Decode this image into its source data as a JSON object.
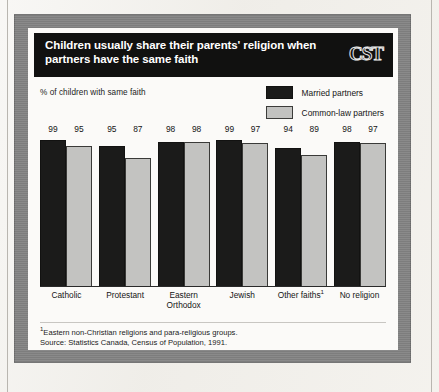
{
  "figure": {
    "title": "Children usually share their parents' religion when\npartners have the same faith",
    "logo": "CST",
    "axis_note": "% of children with same faith"
  },
  "legend": {
    "position": "top-right",
    "items": [
      {
        "label": "Married partners",
        "color": "#1b1b1a",
        "swatch": "dark"
      },
      {
        "label": "Common-law partners",
        "color": "#c3c3c1",
        "swatch": "light"
      }
    ]
  },
  "footnotes": [
    {
      "marker": "1",
      "text": "Eastern non-Christian religions and para-religious groups."
    },
    {
      "marker": "",
      "text": "Source: Statistics Canada, Census of Population, 1991."
    }
  ],
  "chart_data": {
    "type": "bar",
    "title": "Children usually share their parents' religion when partners have the same faith",
    "subtitle": "",
    "xlabel": "",
    "ylabel": "% of children with same faith",
    "ylim": [
      0,
      100
    ],
    "grid": false,
    "legend_position": "top-right",
    "categories": [
      "Catholic",
      "Protestant",
      "Eastern\nOrthodox",
      "Jewish",
      "Other faiths",
      "No religion"
    ],
    "category_footnote_markers": [
      "",
      "",
      "",
      "",
      "1",
      ""
    ],
    "series": [
      {
        "name": "Married partners",
        "color": "#1b1b1a",
        "values": [
          99,
          95,
          98,
          99,
          94,
          98
        ]
      },
      {
        "name": "Common-law partners",
        "color": "#c3c3c1",
        "values": [
          95,
          87,
          98,
          97,
          89,
          97
        ]
      }
    ]
  }
}
